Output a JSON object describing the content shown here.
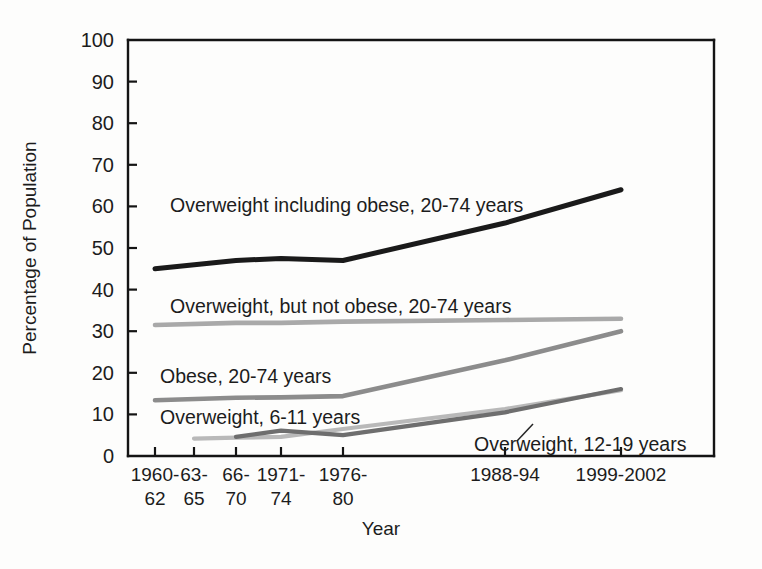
{
  "chart_data": {
    "type": "line",
    "title": "",
    "xlabel": "Year",
    "ylabel": "Percentage of Population",
    "ylim": [
      0,
      100
    ],
    "ytick_values": [
      0,
      10,
      20,
      30,
      40,
      50,
      60,
      70,
      80,
      90,
      100
    ],
    "ytick_labels": [
      "0",
      "10",
      "20",
      "30",
      "40",
      "50",
      "60",
      "70",
      "80",
      "90",
      "100"
    ],
    "categories": [
      "1960-62",
      "63-65",
      "66-70",
      "1971-74",
      "1976-80",
      "1988-94",
      "1999-2002"
    ],
    "xtick_labels_line1": [
      "1960-",
      "63-",
      "66-",
      "1971-",
      "1976-",
      "1988-94",
      "1999-2002"
    ],
    "xtick_labels_line2": [
      "62",
      "65",
      "70",
      "74",
      "80",
      "",
      ""
    ],
    "grid": false,
    "legend_position": "inline-annotations",
    "series": [
      {
        "name": "Overweight including obese, 20-74 years",
        "color": "#1a1a1a",
        "width": 5.0,
        "x": [
          "1960-62",
          "66-70",
          "1971-74",
          "1976-80",
          "1988-94",
          "1999-2002"
        ],
        "values": [
          45,
          47,
          47.5,
          47,
          56,
          64
        ]
      },
      {
        "name": "Overweight, but not obese, 20-74 years",
        "color": "#a9a9a9",
        "width": 4.6,
        "x": [
          "1960-62",
          "66-70",
          "1971-74",
          "1976-80",
          "1988-94",
          "1999-2002"
        ],
        "values": [
          31.5,
          32,
          32,
          32.3,
          32.7,
          33
        ]
      },
      {
        "name": "Obese, 20-74 years",
        "color": "#8c8c8c",
        "width": 4.6,
        "x": [
          "1960-62",
          "66-70",
          "1971-74",
          "1976-80",
          "1988-94",
          "1999-2002"
        ],
        "values": [
          13.4,
          14,
          14.1,
          14.4,
          23,
          30
        ]
      },
      {
        "name": "Overweight, 6-11 years",
        "color": "#b9b9b9",
        "width": 4.2,
        "x": [
          "63-65",
          "66-70",
          "1971-74",
          "1976-80",
          "1988-94",
          "1999-2002"
        ],
        "values": [
          4.2,
          4.4,
          4.6,
          6.5,
          11.3,
          15.8
        ]
      },
      {
        "name": "Overweight, 12-19 years",
        "color": "#6e6e6e",
        "width": 4.2,
        "x": [
          "66-70",
          "1971-74",
          "1976-80",
          "1988-94",
          "1999-2002"
        ],
        "values": [
          4.6,
          6.1,
          5.0,
          10.5,
          16.1
        ]
      }
    ],
    "annotations": [
      {
        "text": "Overweight including obese, 20-74 years",
        "x_px": 170,
        "y_px": 212
      },
      {
        "text": "Overweight, but not obese, 20-74 years",
        "x_px": 170,
        "y_px": 313
      },
      {
        "text": "Obese, 20-74 years",
        "x_px": 160,
        "y_px": 383
      },
      {
        "text": "Overweight, 6-11 years",
        "x_px": 160,
        "y_px": 424
      },
      {
        "text": "Overweight, 12-19 years",
        "x_px": 474,
        "y_px": 451
      }
    ]
  }
}
